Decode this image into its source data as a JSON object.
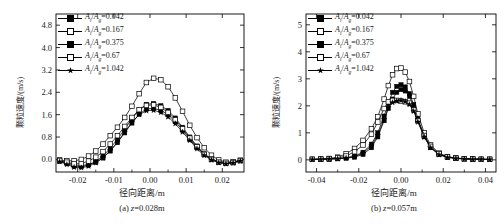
{
  "figure": {
    "panels": [
      {
        "id": "a",
        "caption_prefix": "(a)",
        "caption_var": "z",
        "caption_value": "=0.028m",
        "xlabel": "径向距离/m",
        "ylabel": "颗粒速度/(m/s)",
        "xticks": [
          "-0.02",
          "-0.01",
          "0.00",
          "0.01",
          "0.02"
        ],
        "yticks": [
          "0.0",
          "0.8",
          "1.6",
          "2.4",
          "3.2",
          "4.0",
          "4.8"
        ]
      },
      {
        "id": "b",
        "caption_prefix": "(b)",
        "caption_var": "z",
        "caption_value": "=0.057m",
        "xlabel": "径向距离/m",
        "ylabel": "颗粒速度/(m/s)",
        "xticks": [
          "-0.04",
          "-0.02",
          "0.00",
          "0.02",
          "0.04"
        ],
        "yticks": [
          "0",
          "1",
          "2",
          "3",
          "4",
          "5"
        ]
      }
    ],
    "legend_labels": [
      "=0.042",
      "=0.167",
      "=0.375",
      "=0.67",
      "=1.042"
    ],
    "legend_numer": "A",
    "legend_numer_sub": "i",
    "legend_denom": "A",
    "legend_denom_sub": "g"
  },
  "chart_data": [
    {
      "type": "line",
      "title": "(a) z=0.028m",
      "xlabel": "径向距离/m",
      "ylabel": "颗粒速度/(m/s)",
      "xlim": [
        -0.026,
        0.026
      ],
      "ylim": [
        -0.45,
        5.2
      ],
      "xticks": [
        -0.02,
        -0.01,
        0.0,
        0.01,
        0.02
      ],
      "yticks": [
        0.0,
        0.8,
        1.6,
        2.4,
        3.2,
        4.0,
        4.8
      ],
      "grid": false,
      "legend_position": "upper-left",
      "series": [
        {
          "name": "Ai/Ag=0.042",
          "marker": "filled-square",
          "x": [
            -0.025,
            -0.023,
            -0.021,
            -0.019,
            -0.017,
            -0.015,
            -0.013,
            -0.011,
            -0.009,
            -0.007,
            -0.005,
            -0.003,
            -0.001,
            0.001,
            0.003,
            0.005,
            0.007,
            0.009,
            0.011,
            0.013,
            0.015,
            0.017,
            0.019,
            0.021,
            0.023,
            0.025
          ],
          "y": [
            -0.05,
            -0.12,
            -0.2,
            -0.22,
            -0.18,
            -0.1,
            0.05,
            0.3,
            0.6,
            0.95,
            1.3,
            1.62,
            1.8,
            1.83,
            1.75,
            1.6,
            1.35,
            1.05,
            0.72,
            0.42,
            0.18,
            0.02,
            -0.08,
            -0.13,
            -0.1,
            -0.04
          ]
        },
        {
          "name": "Ai/Ag=0.167",
          "marker": "open-square",
          "x": [
            -0.025,
            -0.023,
            -0.021,
            -0.019,
            -0.017,
            -0.015,
            -0.013,
            -0.011,
            -0.009,
            -0.007,
            -0.005,
            -0.003,
            -0.001,
            0.001,
            0.003,
            0.005,
            0.007,
            0.009,
            0.011,
            0.013,
            0.015,
            0.017,
            0.019,
            0.021,
            0.023,
            0.025
          ],
          "y": [
            -0.02,
            -0.05,
            -0.05,
            0.0,
            0.12,
            0.3,
            0.55,
            0.85,
            1.15,
            1.5,
            1.9,
            2.35,
            2.75,
            2.9,
            2.85,
            2.6,
            2.2,
            1.72,
            1.22,
            0.78,
            0.42,
            0.15,
            -0.02,
            -0.1,
            -0.08,
            -0.03
          ]
        },
        {
          "name": "Ai/Ag=0.375",
          "marker": "filled-square",
          "x": [
            -0.025,
            -0.023,
            -0.021,
            -0.019,
            -0.017,
            -0.015,
            -0.013,
            -0.011,
            -0.009,
            -0.007,
            -0.005,
            -0.003,
            -0.001,
            0.001,
            0.003,
            0.005,
            0.007,
            0.009,
            0.011,
            0.013,
            0.015,
            0.017,
            0.019,
            0.021,
            0.023,
            0.025
          ],
          "y": [
            -0.06,
            -0.15,
            -0.24,
            -0.26,
            -0.2,
            -0.08,
            0.12,
            0.4,
            0.72,
            1.08,
            1.45,
            1.78,
            1.97,
            2.0,
            1.92,
            1.75,
            1.48,
            1.15,
            0.8,
            0.48,
            0.2,
            0.02,
            -0.1,
            -0.15,
            -0.12,
            -0.05
          ]
        },
        {
          "name": "Ai/Ag=0.67",
          "marker": "open-square",
          "x": [
            -0.025,
            -0.023,
            -0.021,
            -0.019,
            -0.017,
            -0.015,
            -0.013,
            -0.011,
            -0.009,
            -0.007,
            -0.005,
            -0.003,
            -0.001,
            0.001,
            0.003,
            0.005,
            0.007,
            0.009,
            0.011,
            0.013,
            0.015,
            0.017,
            0.019,
            0.021,
            0.023,
            0.025
          ],
          "y": [
            -0.04,
            -0.1,
            -0.16,
            -0.15,
            -0.06,
            0.08,
            0.28,
            0.55,
            0.85,
            1.18,
            1.5,
            1.78,
            1.93,
            1.95,
            1.86,
            1.68,
            1.42,
            1.1,
            0.76,
            0.45,
            0.18,
            0.0,
            -0.1,
            -0.14,
            -0.11,
            -0.04
          ]
        },
        {
          "name": "Ai/Ag=1.042",
          "marker": "filled-star",
          "x": [
            -0.025,
            -0.023,
            -0.021,
            -0.019,
            -0.017,
            -0.015,
            -0.013,
            -0.011,
            -0.009,
            -0.007,
            -0.005,
            -0.003,
            -0.001,
            0.001,
            0.003,
            0.005,
            0.007,
            0.009,
            0.011,
            0.013,
            0.015,
            0.017,
            0.019,
            0.021,
            0.023,
            0.025
          ],
          "y": [
            -0.08,
            -0.18,
            -0.28,
            -0.3,
            -0.24,
            -0.12,
            0.06,
            0.32,
            0.62,
            0.98,
            1.32,
            1.6,
            1.74,
            1.76,
            1.68,
            1.52,
            1.28,
            0.98,
            0.68,
            0.38,
            0.14,
            -0.02,
            -0.12,
            -0.16,
            -0.13,
            -0.06
          ]
        }
      ]
    },
    {
      "type": "line",
      "title": "(b) z=0.057m",
      "xlabel": "径向距离/m",
      "ylabel": "颗粒速度/(m/s)",
      "xlim": [
        -0.045,
        0.045
      ],
      "ylim": [
        -0.45,
        5.4
      ],
      "xticks": [
        -0.04,
        -0.02,
        0.0,
        0.02,
        0.04
      ],
      "yticks": [
        0,
        1,
        2,
        3,
        4,
        5
      ],
      "grid": false,
      "legend_position": "upper-left",
      "series": [
        {
          "name": "Ai/Ag=0.042",
          "marker": "filled-square",
          "x": [
            -0.042,
            -0.038,
            -0.034,
            -0.03,
            -0.026,
            -0.022,
            -0.018,
            -0.014,
            -0.011,
            -0.008,
            -0.006,
            -0.004,
            -0.002,
            0.0,
            0.002,
            0.004,
            0.006,
            0.008,
            0.011,
            0.014,
            0.018,
            0.022,
            0.026,
            0.03,
            0.034,
            0.038,
            0.042
          ],
          "y": [
            0.02,
            0.02,
            0.03,
            0.04,
            0.06,
            0.1,
            0.2,
            0.45,
            0.85,
            1.45,
            1.9,
            2.25,
            2.5,
            2.6,
            2.55,
            2.35,
            1.95,
            1.45,
            0.85,
            0.45,
            0.2,
            0.1,
            0.06,
            0.04,
            0.03,
            0.02,
            0.02
          ]
        },
        {
          "name": "Ai/Ag=0.167",
          "marker": "open-square",
          "x": [
            -0.042,
            -0.038,
            -0.034,
            -0.03,
            -0.026,
            -0.022,
            -0.018,
            -0.014,
            -0.011,
            -0.008,
            -0.006,
            -0.004,
            -0.002,
            0.0,
            0.002,
            0.004,
            0.006,
            0.008,
            0.011,
            0.014,
            0.018,
            0.022,
            0.026,
            0.03,
            0.034,
            0.038,
            0.042
          ],
          "y": [
            0.02,
            0.03,
            0.05,
            0.1,
            0.22,
            0.42,
            0.72,
            1.15,
            1.6,
            2.25,
            2.75,
            3.15,
            3.38,
            3.4,
            3.25,
            2.9,
            2.35,
            1.7,
            1.0,
            0.55,
            0.25,
            0.12,
            0.07,
            0.04,
            0.03,
            0.02,
            0.02
          ]
        },
        {
          "name": "Ai/Ag=0.375",
          "marker": "filled-square",
          "x": [
            -0.042,
            -0.038,
            -0.034,
            -0.03,
            -0.026,
            -0.022,
            -0.018,
            -0.014,
            -0.011,
            -0.008,
            -0.006,
            -0.004,
            -0.002,
            0.0,
            0.002,
            0.004,
            0.006,
            0.008,
            0.011,
            0.014,
            0.018,
            0.022,
            0.026,
            0.03,
            0.034,
            0.038,
            0.042
          ],
          "y": [
            0.02,
            0.02,
            0.03,
            0.05,
            0.08,
            0.14,
            0.28,
            0.58,
            1.0,
            1.62,
            2.1,
            2.5,
            2.72,
            2.78,
            2.7,
            2.45,
            2.05,
            1.52,
            0.9,
            0.48,
            0.2,
            0.1,
            0.06,
            0.04,
            0.03,
            0.02,
            0.02
          ]
        },
        {
          "name": "Ai/Ag=0.67",
          "marker": "open-square",
          "x": [
            -0.042,
            -0.038,
            -0.034,
            -0.03,
            -0.026,
            -0.022,
            -0.018,
            -0.014,
            -0.011,
            -0.008,
            -0.006,
            -0.004,
            -0.002,
            0.0,
            0.002,
            0.004,
            0.006,
            0.008,
            0.011,
            0.014,
            0.018,
            0.022,
            0.026,
            0.03,
            0.034,
            0.038,
            0.042
          ],
          "y": [
            0.02,
            0.03,
            0.04,
            0.07,
            0.14,
            0.3,
            0.55,
            0.95,
            1.4,
            1.9,
            2.15,
            2.2,
            2.2,
            2.18,
            2.15,
            2.1,
            1.85,
            1.45,
            0.9,
            0.5,
            0.22,
            0.11,
            0.06,
            0.04,
            0.03,
            0.02,
            0.02
          ]
        },
        {
          "name": "Ai/Ag=1.042",
          "marker": "filled-star",
          "x": [
            -0.042,
            -0.038,
            -0.034,
            -0.03,
            -0.026,
            -0.022,
            -0.018,
            -0.014,
            -0.011,
            -0.008,
            -0.006,
            -0.004,
            -0.002,
            0.0,
            0.002,
            0.004,
            0.006,
            0.008,
            0.011,
            0.014,
            0.018,
            0.022,
            0.026,
            0.03,
            0.034,
            0.038,
            0.042
          ],
          "y": [
            0.01,
            0.02,
            0.03,
            0.04,
            0.07,
            0.12,
            0.25,
            0.52,
            0.92,
            1.5,
            1.95,
            2.12,
            2.18,
            2.2,
            2.16,
            2.05,
            1.8,
            1.4,
            0.85,
            0.45,
            0.19,
            0.09,
            0.05,
            0.03,
            0.02,
            0.02,
            0.01
          ]
        }
      ]
    }
  ]
}
